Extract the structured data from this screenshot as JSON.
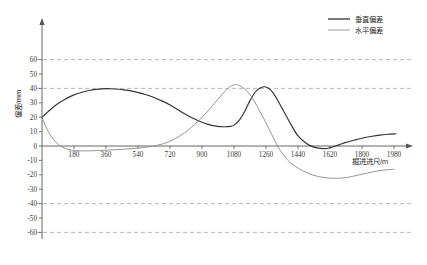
{
  "chart_data": {
    "type": "line",
    "title": "",
    "xlabel": "掘进进尺/m",
    "ylabel": "偏差/mm",
    "xlim": [
      0,
      2070
    ],
    "ylim": [
      -66,
      66
    ],
    "grid": true,
    "gridlines_y": [
      60,
      40,
      -40,
      -60
    ],
    "legend_position": "top-right",
    "xticks": [
      180,
      360,
      540,
      720,
      900,
      1080,
      1260,
      1440,
      1620,
      1800,
      1980
    ],
    "xtick_labels": [
      "180",
      "360",
      "540",
      "720",
      "900",
      "1080",
      "1260",
      "1440",
      "1620",
      "1800",
      "1980"
    ],
    "yticks": [
      60,
      50,
      40,
      30,
      20,
      10,
      0,
      -10,
      -20,
      -30,
      -40,
      -50,
      -60
    ],
    "ytick_labels": [
      "60",
      "50",
      "40",
      "30",
      "20",
      "10",
      "0",
      "-10",
      "-20",
      "-30",
      "-40",
      "-50",
      "-60"
    ],
    "series": [
      {
        "name": "垂直偏差",
        "color": "#333333",
        "width": 1.15,
        "x": [
          0,
          40,
          80,
          120,
          170,
          220,
          270,
          320,
          360,
          410,
          460,
          520,
          570,
          620,
          680,
          720,
          780,
          830,
          880,
          930,
          980,
          1020,
          1060,
          1080,
          1110,
          1140,
          1170,
          1200,
          1230,
          1260,
          1290,
          1320,
          1360,
          1400,
          1440,
          1490,
          1530,
          1580,
          1620,
          1670,
          1710,
          1760,
          1800,
          1850,
          1900,
          1950,
          1990
        ],
        "y": [
          20.0,
          24.5,
          28.6,
          31.8,
          35.0,
          37.2,
          38.7,
          39.5,
          39.8,
          39.6,
          39.0,
          37.8,
          36.2,
          34.2,
          31.0,
          28.5,
          24.0,
          20.5,
          17.5,
          15.2,
          13.8,
          13.4,
          13.6,
          14.5,
          18.0,
          24.0,
          31.5,
          37.5,
          40.5,
          41.0,
          38.5,
          33.0,
          24.0,
          15.0,
          7.0,
          1.5,
          -0.8,
          -1.8,
          -1.2,
          0.8,
          2.5,
          4.2,
          5.4,
          6.6,
          7.6,
          8.2,
          8.5
        ]
      },
      {
        "name": "水平偏差",
        "color": "#8a8a8a",
        "width": 0.9,
        "x": [
          0,
          25,
          50,
          80,
          110,
          150,
          190,
          230,
          280,
          330,
          380,
          440,
          500,
          560,
          620,
          680,
          740,
          800,
          860,
          920,
          970,
          1010,
          1050,
          1080,
          1110,
          1150,
          1190,
          1230,
          1260,
          1290,
          1330,
          1380,
          1430,
          1480,
          1530,
          1580,
          1630,
          1680,
          1730,
          1780,
          1830,
          1880,
          1930,
          1980
        ],
        "y": [
          20.0,
          12.5,
          7.0,
          2.5,
          -0.5,
          -2.5,
          -3.2,
          -3.4,
          -3.3,
          -3.1,
          -2.8,
          -2.4,
          -1.9,
          -1.2,
          -0.2,
          1.5,
          4.5,
          9.0,
          15.0,
          22.5,
          29.5,
          35.5,
          40.5,
          42.5,
          42.0,
          38.5,
          32.0,
          23.0,
          16.0,
          8.5,
          -1.0,
          -9.5,
          -14.5,
          -18.0,
          -20.4,
          -21.8,
          -22.4,
          -22.3,
          -21.5,
          -20.2,
          -18.8,
          -17.5,
          -16.6,
          -16.2
        ]
      }
    ]
  },
  "legend": {
    "items": [
      {
        "label": "垂直偏差",
        "color": "#333333"
      },
      {
        "label": "水平偏差",
        "color": "#8a8a8a"
      }
    ]
  },
  "axes": {
    "y_title": "偏差/mm",
    "x_title": "掘进进尺/m"
  }
}
